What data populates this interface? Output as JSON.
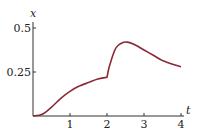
{
  "chart_data": {
    "type": "line",
    "title": "",
    "xlabel": "t",
    "ylabel": "x",
    "xlim": [
      0,
      4
    ],
    "ylim": [
      0,
      0.5
    ],
    "x_ticks": [
      "1",
      "2",
      "3",
      "4"
    ],
    "y_ticks": [
      "0.25",
      "0.5"
    ],
    "grid": false,
    "line_color": "#8b2a35",
    "series": [
      {
        "name": "x(t)",
        "x": [
          0,
          0.25,
          0.5,
          0.75,
          1.0,
          1.25,
          1.5,
          1.75,
          2.0,
          2.05,
          2.15,
          2.25,
          2.4,
          2.55,
          2.75,
          3.0,
          3.25,
          3.5,
          3.75,
          4.0
        ],
        "y": [
          0,
          0.01,
          0.05,
          0.1,
          0.14,
          0.17,
          0.19,
          0.21,
          0.22,
          0.27,
          0.34,
          0.39,
          0.415,
          0.42,
          0.405,
          0.375,
          0.345,
          0.315,
          0.295,
          0.28
        ]
      }
    ]
  }
}
